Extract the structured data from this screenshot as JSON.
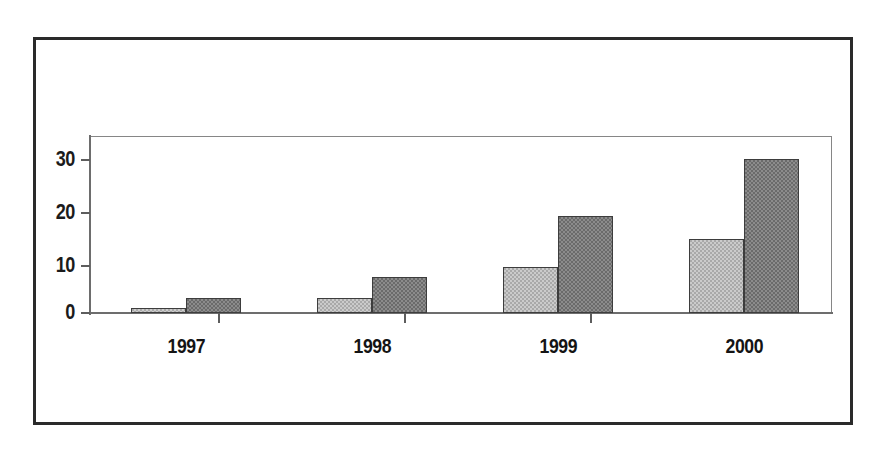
{
  "chart_data": {
    "type": "bar",
    "title": "",
    "subtitle": "",
    "xlabel": "",
    "ylabel": "",
    "categories": [
      "1997",
      "1998",
      "1999",
      "2000"
    ],
    "series": [
      {
        "name": "Series 1",
        "color": "#a9a9a9",
        "values": [
          1,
          3,
          9,
          14.5
        ]
      },
      {
        "name": "Series 2",
        "color": "#6b6b6b",
        "values": [
          3,
          7,
          19,
          30
        ]
      }
    ],
    "y_ticks": [
      0,
      10,
      20,
      30
    ],
    "ylim": [
      0,
      34.5
    ],
    "grid": false,
    "legend": "none",
    "grouping": "clustered"
  },
  "axes": {
    "y_tick_labels": [
      "30",
      "20",
      "10",
      "0"
    ],
    "x_tick_labels": [
      "1997",
      "1998",
      "1999",
      "2000"
    ]
  },
  "style": {
    "background": "#ffffff",
    "frame_color": "#2a2a2a",
    "axis_color": "#6d6d6d",
    "plot_border_color": "#868686",
    "bar_outline": "#3d3d3d",
    "series_a_fill": "#a9a9a9",
    "series_b_fill": "#6b6b6b",
    "text_color": "#141414"
  }
}
